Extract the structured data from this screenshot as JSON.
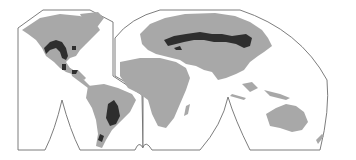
{
  "map": {
    "projection": "interrupted-world-map",
    "colors": {
      "background": "#ffffff",
      "outline": "#6e6e6e",
      "land": "#a8a8a8",
      "highlighted_region": "#2e2e2e"
    },
    "highlighted_regions": [
      "North American Great Plains",
      "Mexican highlands",
      "South American Pampas",
      "Patagonia",
      "Eurasian Steppe"
    ]
  }
}
